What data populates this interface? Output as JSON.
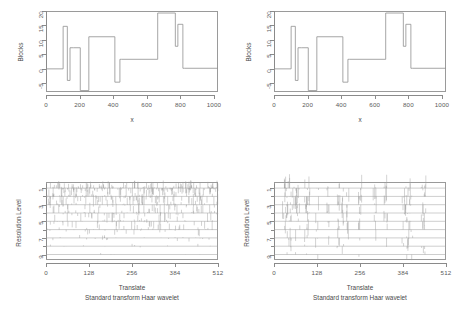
{
  "figure": {
    "layout": "2x2 panel grid",
    "line_color": "#8f8f8f",
    "background": "#ffffff"
  },
  "panels": [
    {
      "id": "top-left",
      "chart_data": {
        "type": "line",
        "subtype": "step",
        "title": "",
        "xlabel": "x",
        "ylabel": "Blocks",
        "xlim": [
          0,
          1024
        ],
        "ylim": [
          -8,
          20
        ],
        "xticks": [
          0,
          200,
          400,
          600,
          800,
          1000
        ],
        "yticks": [
          -5,
          0,
          5,
          10,
          15,
          20
        ],
        "grid": false,
        "legend": null,
        "x": [
          0,
          102,
          102,
          127,
          127,
          143,
          143,
          163,
          163,
          204,
          204,
          255,
          255,
          256,
          256,
          410,
          410,
          440,
          440,
          450,
          450,
          665,
          665,
          770,
          770,
          785,
          785,
          815,
          815,
          825,
          825,
          1024
        ],
        "values": [
          0,
          0,
          14.7,
          14.7,
          -4.0,
          -4.0,
          7.3,
          7.3,
          7.3,
          7.3,
          -7.5,
          -7.5,
          11.1,
          11.1,
          11.1,
          11.1,
          -4.6,
          -4.6,
          3.3,
          3.3,
          3.3,
          3.3,
          19.3,
          19.3,
          7.8,
          7.8,
          15.4,
          15.4,
          0.2,
          0.2,
          0.2,
          0.2
        ]
      }
    },
    {
      "id": "top-right",
      "chart_data": {
        "type": "line",
        "subtype": "step",
        "title": "",
        "xlabel": "x",
        "ylabel": "Blocks",
        "xlim": [
          0,
          1024
        ],
        "ylim": [
          -8,
          20
        ],
        "xticks": [
          0,
          200,
          400,
          600,
          800,
          1000
        ],
        "yticks": [
          -5,
          0,
          5,
          10,
          15,
          20
        ],
        "grid": false,
        "legend": null,
        "x": [
          0,
          102,
          102,
          127,
          127,
          143,
          143,
          163,
          163,
          204,
          204,
          255,
          255,
          256,
          256,
          410,
          410,
          440,
          440,
          450,
          450,
          665,
          665,
          770,
          770,
          785,
          785,
          815,
          815,
          825,
          825,
          1024
        ],
        "values": [
          0,
          0,
          14.7,
          14.7,
          -4.0,
          -4.0,
          7.3,
          7.3,
          7.3,
          7.3,
          -7.5,
          -7.5,
          11.1,
          11.1,
          11.1,
          11.1,
          -4.6,
          -4.6,
          3.3,
          3.3,
          3.3,
          3.3,
          19.3,
          19.3,
          7.8,
          7.8,
          15.4,
          15.4,
          0.2,
          0.2,
          0.2,
          0.2
        ]
      }
    },
    {
      "id": "bottom-left",
      "chart_data": {
        "type": "scatter",
        "subtype": "wavelet-coefficient-stem-plot",
        "title": "",
        "xlabel": "Translate",
        "ylabel": "Resolution Level",
        "subtitle": "Standard transform Haar wavelet",
        "xlim": [
          0,
          512
        ],
        "ylim_levels": [
          1,
          9
        ],
        "xticks": [
          0,
          128,
          256,
          384,
          512
        ],
        "yticks": [
          1,
          3,
          5,
          7,
          9
        ],
        "grid": false,
        "legend": null,
        "levels": [
          {
            "level": 1,
            "n_coefs": 256,
            "spread": "dense-uniform",
            "amp": 0.3
          },
          {
            "level": 2,
            "n_coefs": 128,
            "spread": "dense-uniform",
            "amp": 0.38
          },
          {
            "level": 3,
            "n_coefs": 96,
            "spread": "dense-uniform",
            "amp": 0.42
          },
          {
            "level": 4,
            "n_coefs": 80,
            "spread": "dense-uniform",
            "amp": 0.4
          },
          {
            "level": 5,
            "n_coefs": 64,
            "spread": "dense-uniform",
            "amp": 0.34
          },
          {
            "level": 6,
            "n_coefs": 48,
            "spread": "dense-uniform",
            "amp": 0.26
          },
          {
            "level": 7,
            "n_coefs": 24,
            "spread": "dense-uniform",
            "amp": 0.16
          },
          {
            "level": 8,
            "n_coefs": 12,
            "spread": "dense-uniform",
            "amp": 0.1
          },
          {
            "level": 9,
            "n_coefs": 6,
            "spread": "dense-uniform",
            "amp": 0.06
          }
        ]
      }
    },
    {
      "id": "bottom-right",
      "chart_data": {
        "type": "scatter",
        "subtype": "wavelet-coefficient-stem-plot",
        "title": "",
        "xlabel": "Translate",
        "ylabel": "Resolution Level",
        "subtitle": "Standard transform Haar wavelet",
        "xlim": [
          0,
          512
        ],
        "ylim_levels": [
          1,
          9
        ],
        "xticks": [
          0,
          128,
          256,
          384,
          512
        ],
        "yticks": [
          1,
          3,
          5,
          7,
          9
        ],
        "grid": false,
        "legend": null,
        "levels": [
          {
            "level": 1,
            "n_coefs": 60,
            "spread": "clustered-at-jumps",
            "amp": 0.55
          },
          {
            "level": 2,
            "n_coefs": 52,
            "spread": "clustered-at-jumps",
            "amp": 0.55
          },
          {
            "level": 3,
            "n_coefs": 46,
            "spread": "clustered-at-jumps",
            "amp": 0.52
          },
          {
            "level": 4,
            "n_coefs": 40,
            "spread": "clustered-at-jumps",
            "amp": 0.5
          },
          {
            "level": 5,
            "n_coefs": 34,
            "spread": "clustered-at-jumps",
            "amp": 0.48
          },
          {
            "level": 6,
            "n_coefs": 28,
            "spread": "clustered-at-jumps",
            "amp": 0.45
          },
          {
            "level": 7,
            "n_coefs": 22,
            "spread": "clustered-at-jumps",
            "amp": 0.4
          },
          {
            "level": 8,
            "n_coefs": 16,
            "spread": "clustered-at-jumps",
            "amp": 0.35
          },
          {
            "level": 9,
            "n_coefs": 10,
            "spread": "clustered-at-jumps",
            "amp": 0.3
          }
        ],
        "jump_locations": [
          30,
          36,
          42,
          51,
          64,
          72,
          96,
          102,
          128,
          160,
          192,
          205,
          220,
          256,
          300,
          332,
          384,
          392,
          400,
          408,
          440,
          448
        ]
      }
    }
  ],
  "labels": {
    "blocks": "Blocks",
    "x": "x",
    "translate": "Translate",
    "resolution_level": "Resolution Level",
    "standard_transform": "Standard transform Haar wavelet",
    "xticks_top": [
      "0",
      "200",
      "400",
      "600",
      "800",
      "1000"
    ],
    "yticks_top": [
      "20",
      "15",
      "10",
      "5",
      "0",
      "-5"
    ],
    "xticks_bottom": [
      "0",
      "128",
      "256",
      "384",
      "512"
    ],
    "yticks_bottom": [
      "1",
      "3",
      "5",
      "7",
      "9"
    ]
  }
}
